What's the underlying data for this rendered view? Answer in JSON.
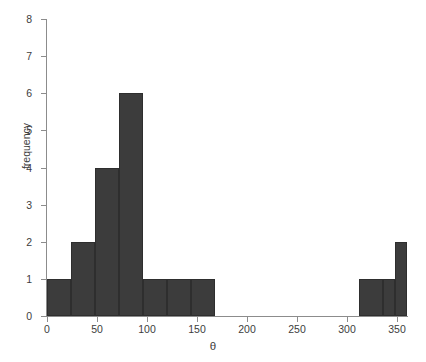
{
  "chart_data": {
    "type": "bar",
    "title": "",
    "subtitle": "",
    "xlabel": "θ",
    "ylabel": "frequency",
    "xlim": [
      0,
      360
    ],
    "ylim": [
      0,
      8
    ],
    "grid": false,
    "legend": null,
    "bin_width": 24,
    "bin_edges": [
      0,
      24,
      48,
      72,
      96,
      120,
      144,
      168,
      192,
      216,
      240,
      264,
      288,
      312,
      336,
      360
    ],
    "categories": [
      "0–24",
      "24–48",
      "48–72",
      "72–96",
      "96–120",
      "120–144",
      "144–168",
      "168–192",
      "192–216",
      "216–240",
      "240–264",
      "264–288",
      "288–312",
      "312–336",
      "336–360"
    ],
    "values": [
      1,
      2,
      4,
      6,
      1,
      1,
      1,
      0,
      0,
      0,
      0,
      0,
      0,
      1,
      1
    ],
    "bars": [
      {
        "x0": 0,
        "x1": 24,
        "value": 1
      },
      {
        "x0": 24,
        "x1": 48,
        "value": 2
      },
      {
        "x0": 48,
        "x1": 72,
        "value": 4
      },
      {
        "x0": 72,
        "x1": 96,
        "value": 6
      },
      {
        "x0": 96,
        "x1": 120,
        "value": 1
      },
      {
        "x0": 120,
        "x1": 144,
        "value": 1
      },
      {
        "x0": 144,
        "x1": 168,
        "value": 1
      },
      {
        "x0": 312,
        "x1": 336,
        "value": 1
      },
      {
        "x0": 336,
        "x1": 348,
        "value": 1
      },
      {
        "x0": 348,
        "x1": 360,
        "value": 2
      }
    ],
    "xticks": [
      0,
      50,
      100,
      150,
      200,
      250,
      300,
      350
    ],
    "xtick_labels": [
      "0",
      "50",
      "100",
      "150",
      "200",
      "250",
      "300",
      "350"
    ],
    "yticks": [
      0,
      1,
      2,
      3,
      4,
      5,
      6,
      7,
      8
    ],
    "ytick_labels": [
      "0",
      "1",
      "2",
      "3",
      "4",
      "5",
      "6",
      "7",
      "8"
    ],
    "colors": {
      "bar_fill": "#3c3c3c",
      "bar_edge": "#2e2e2e",
      "axis": "#8c8c8c",
      "text": "#3d3d3d",
      "background": "#ffffff"
    }
  }
}
